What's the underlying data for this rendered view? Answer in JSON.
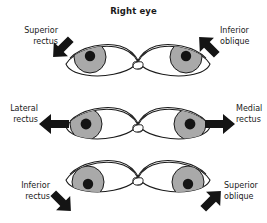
{
  "figure": {
    "title": "Right eye",
    "width": 267,
    "height": 223,
    "background": "#ffffff",
    "ink_color": "#1a1a1a",
    "iris_color": "#a9a9a9",
    "pupil_color": "#141414",
    "sclera_color": "#ffffff"
  },
  "panels": [
    {
      "id": "superior-rectus",
      "row": 0,
      "column": 0,
      "label_line1": "Superior",
      "label_line2": "rectus",
      "label_align": "right",
      "gaze": "up-and-out",
      "arrow_direction": "up-left",
      "arrow_angle_deg": -135,
      "eye_mirrored": false,
      "iris_offset_x": -4,
      "iris_offset_y": -3
    },
    {
      "id": "inferior-oblique",
      "row": 0,
      "column": 1,
      "label_line1": "Inferior",
      "label_line2": "oblique",
      "label_align": "left",
      "gaze": "up-and-in",
      "arrow_direction": "up-right",
      "arrow_angle_deg": -45,
      "eye_mirrored": true,
      "iris_offset_x": 4,
      "iris_offset_y": -3
    },
    {
      "id": "lateral-rectus",
      "row": 1,
      "column": 0,
      "label_line1": "Lateral",
      "label_line2": "rectus",
      "label_align": "right",
      "gaze": "out",
      "arrow_direction": "left",
      "arrow_angle_deg": 180,
      "eye_mirrored": false,
      "iris_offset_x": -6,
      "iris_offset_y": 0
    },
    {
      "id": "medial-rectus",
      "row": 1,
      "column": 1,
      "label_line1": "Medial",
      "label_line2": "rectus",
      "label_align": "left",
      "gaze": "in",
      "arrow_direction": "right",
      "arrow_angle_deg": 0,
      "eye_mirrored": true,
      "iris_offset_x": 6,
      "iris_offset_y": 0
    },
    {
      "id": "inferior-rectus",
      "row": 2,
      "column": 0,
      "label_line1": "Inferior",
      "label_line2": "rectus",
      "label_align": "right",
      "gaze": "down-and-out",
      "arrow_direction": "down-left",
      "arrow_angle_deg": 135,
      "eye_mirrored": false,
      "iris_offset_x": -4,
      "iris_offset_y": 3
    },
    {
      "id": "superior-oblique",
      "row": 2,
      "column": 1,
      "label_line1": "Superior",
      "label_line2": "oblique",
      "label_align": "left",
      "gaze": "down-and-in",
      "arrow_direction": "down-right",
      "arrow_angle_deg": 45,
      "eye_mirrored": true,
      "iris_offset_x": 4,
      "iris_offset_y": 3
    }
  ]
}
